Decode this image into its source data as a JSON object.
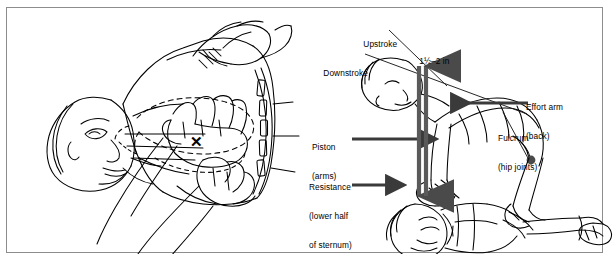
{
  "figure": {
    "border_color": "#8d8d8d",
    "background_color": "#ffffff",
    "ink_color": "#000000"
  },
  "panels": [
    {
      "id": "left",
      "name": "hand-placement-panel",
      "description": "Rescuer locating compression point on supine victim's chest; dashed outline shows heart/ribcage, an X marks the compression site on the lower half of the sternum.",
      "marks": [
        {
          "name": "compression-point-x",
          "glyph": "✕",
          "x": 189,
          "y": 134
        }
      ]
    },
    {
      "id": "right",
      "name": "lever-mechanics-panel",
      "description": "Side view of rescuer kneeling over victim showing the body used as a lever: effort arm, fulcrum, piston and resistance.",
      "labels": [
        {
          "id": "upstroke",
          "name": "label-upstroke",
          "lines": [
            "Upstroke"
          ],
          "x": 348,
          "y": 28
        },
        {
          "id": "downstroke",
          "name": "label-downstroke",
          "lines": [
            "Downstroke"
          ],
          "x": 308,
          "y": 57
        },
        {
          "id": "depth",
          "name": "label-compression-depth",
          "lines": [
            "1½–2 in"
          ],
          "x": 404,
          "y": 45
        },
        {
          "id": "effort-arm",
          "name": "label-effort-arm",
          "lines": [
            "Effort arm",
            "(back)"
          ],
          "x": 525,
          "y": 82
        },
        {
          "id": "fulcrum",
          "name": "label-fulcrum",
          "lines": [
            "Fulcrum",
            "(hip joints)"
          ],
          "x": 497,
          "y": 113
        },
        {
          "id": "piston",
          "name": "label-piston",
          "lines": [
            "Piston",
            "(arms)"
          ],
          "x": 311,
          "y": 122
        },
        {
          "id": "resistance",
          "name": "label-resistance",
          "lines": [
            "Resistance",
            "(lower half",
            "of sternum)"
          ],
          "x": 308,
          "y": 162
        }
      ],
      "pointers": [
        {
          "name": "pointer-upstroke",
          "from": [
            382,
            42
          ],
          "to": [
            438,
            97
          ],
          "head": "none",
          "weight": 0.9
        },
        {
          "name": "pointer-downstroke",
          "from": [
            358,
            66
          ],
          "to": [
            518,
            124
          ],
          "head": "none",
          "weight": 0.9
        },
        {
          "name": "pointer-effort-arm",
          "from": [
            521,
            95
          ],
          "to": [
            441,
            95
          ],
          "head": "left",
          "weight": 3.2
        },
        {
          "name": "pointer-fulcrum",
          "from": [
            494,
            124
          ],
          "to": [
            524,
            124
          ],
          "head": "dot",
          "weight": 0.9
        },
        {
          "name": "pointer-piston",
          "from": [
            345,
            131
          ],
          "to": [
            404,
            131
          ],
          "head": "right",
          "weight": 3.2
        },
        {
          "name": "pointer-resistance",
          "from": [
            345,
            177
          ],
          "to": [
            378,
            177
          ],
          "head": "right",
          "weight": 3.2
        },
        {
          "name": "arrow-compression-down",
          "from": [
            413,
            62
          ],
          "to": [
            413,
            186
          ],
          "head": "down",
          "weight": 4.5
        },
        {
          "name": "arrow-compression-up",
          "from": [
            419,
            186
          ],
          "to": [
            419,
            62
          ],
          "head": "up",
          "weight": 4.5
        }
      ]
    }
  ]
}
